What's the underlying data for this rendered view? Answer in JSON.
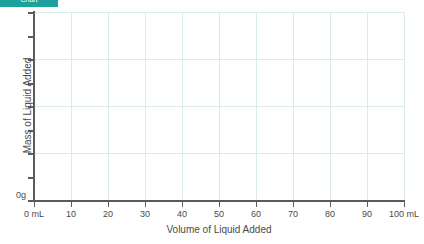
{
  "tab": {
    "label": "Chart",
    "color": "#1ba29b"
  },
  "chart_data": {
    "type": "line",
    "title": "",
    "subtitle": "",
    "xlabel": "Volume of Liquid Added",
    "ylabel": "Mass of Liquid Added",
    "x": [],
    "values": [],
    "series": [],
    "annotations": [],
    "legend": [],
    "legend_position": "none",
    "grid": true,
    "grid_color": "#d9ecea",
    "axis_color": "#5b5b5b",
    "xlim": [
      0,
      100
    ],
    "ylim": [
      0,
      8
    ],
    "x_tick_values": [
      0,
      10,
      20,
      30,
      40,
      50,
      60,
      70,
      80,
      90,
      100
    ],
    "x_tick_labels": [
      "0 mL",
      "10",
      "20",
      "30",
      "40",
      "50",
      "60",
      "70",
      "80",
      "90",
      "100 mL"
    ],
    "y_tick_values": [
      0,
      1,
      2,
      3,
      4,
      5,
      6,
      7,
      8
    ],
    "y_tick_labels": [
      "0g",
      "",
      "",
      "",
      "",
      "",
      "",
      "",
      ""
    ],
    "y_gridline_values": [
      2,
      4,
      6,
      8
    ],
    "x_gridline_values": [
      10,
      20,
      30,
      40,
      50,
      60,
      70,
      80,
      90,
      100
    ]
  }
}
